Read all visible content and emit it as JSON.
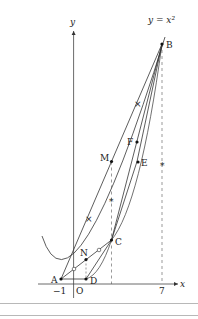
{
  "diagram": {
    "curve_label": "y = x²",
    "axes": {
      "x_label": "x",
      "y_label": "y",
      "origin_label": "O"
    },
    "ticks": {
      "x": [
        "−1",
        "7"
      ]
    },
    "points": [
      {
        "name": "A",
        "x": -1,
        "y": 1
      },
      {
        "name": "B",
        "x": 7,
        "y": 49
      },
      {
        "name": "C",
        "x": 3,
        "y": 9
      },
      {
        "name": "D",
        "x": 1,
        "y": 1
      },
      {
        "name": "E",
        "x": 5,
        "y": 25
      },
      {
        "name": "F",
        "x": 5,
        "y": 29
      },
      {
        "name": "M",
        "x": 3,
        "y": 25
      },
      {
        "name": "N",
        "x": 1,
        "y": 5
      }
    ],
    "labels": {
      "A": "A",
      "B": "B",
      "C": "C",
      "D": "D",
      "E": "E",
      "F": "F",
      "M": "M",
      "N": "N"
    }
  }
}
